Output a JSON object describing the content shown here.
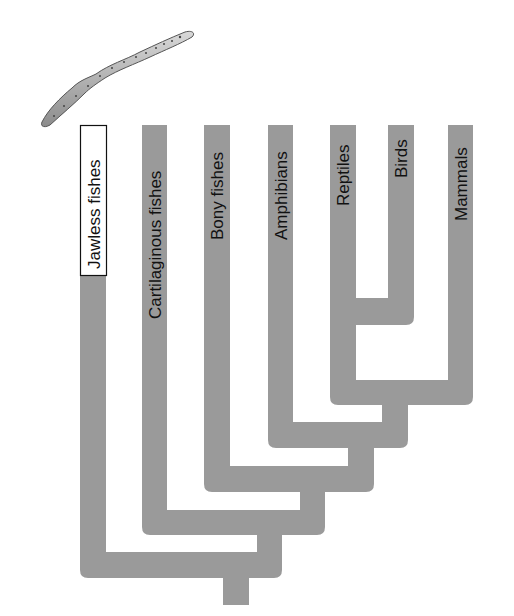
{
  "diagram": {
    "type": "cladogram",
    "branch_color": "#9a9a9a",
    "taxa": [
      {
        "label": "Jawless fishes",
        "highlighted": true
      },
      {
        "label": "Cartilaginous fishes",
        "highlighted": false
      },
      {
        "label": "Bony fishes",
        "highlighted": false
      },
      {
        "label": "Amphibians",
        "highlighted": false
      },
      {
        "label": "Reptiles",
        "highlighted": false
      },
      {
        "label": "Birds",
        "highlighted": false
      },
      {
        "label": "Mammals",
        "highlighted": false
      }
    ],
    "illustration": "lamprey"
  }
}
